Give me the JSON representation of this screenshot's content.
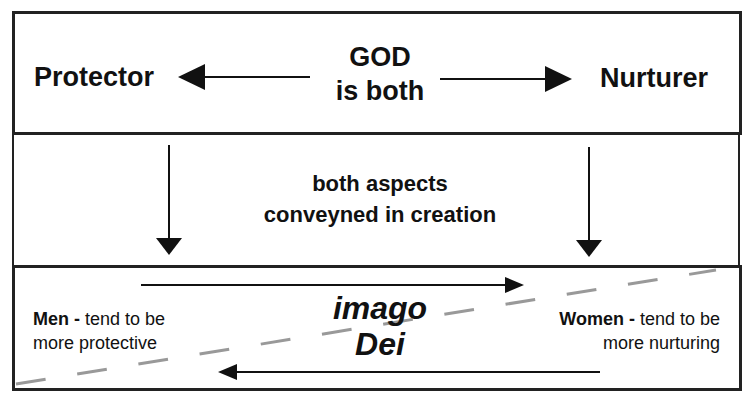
{
  "top": {
    "left_label": "Protector",
    "center_line1": "GOD",
    "center_line2": "is both",
    "right_label": "Nurturer"
  },
  "middle": {
    "line1": "both aspects",
    "line2": "conveyned in creation"
  },
  "bottom": {
    "title_line1": "imago",
    "title_line2": "Dei",
    "men_bold": "Men -",
    "men_text1": " tend to be",
    "men_text2": "more protective",
    "women_bold": "Women -",
    "women_text1": " tend to be",
    "women_text2": "more nurturing"
  },
  "colors": {
    "line": "#111111",
    "dash": "#999999"
  }
}
